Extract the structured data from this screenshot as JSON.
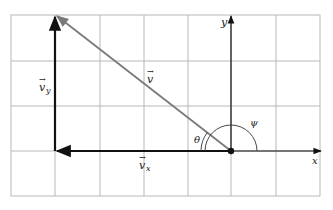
{
  "diagram": {
    "axes": {
      "x_label": "x",
      "y_label": "y"
    },
    "vectors": [
      {
        "id": "v",
        "label": "v",
        "arrow_label": "→",
        "color": "#7a7a7a"
      },
      {
        "id": "vx",
        "label": "v",
        "subscript": "x",
        "arrow_label": "→",
        "color": "#111111"
      },
      {
        "id": "vy",
        "label": "v",
        "subscript": "y",
        "arrow_label": "→",
        "color": "#111111"
      }
    ],
    "angles": [
      {
        "id": "theta",
        "label": "θ"
      },
      {
        "id": "psi",
        "label": "ψ"
      }
    ],
    "grid": {
      "columns": 7,
      "rows": 4,
      "line_color": "#b8b8b8"
    },
    "origin_point": "dot at origin"
  }
}
